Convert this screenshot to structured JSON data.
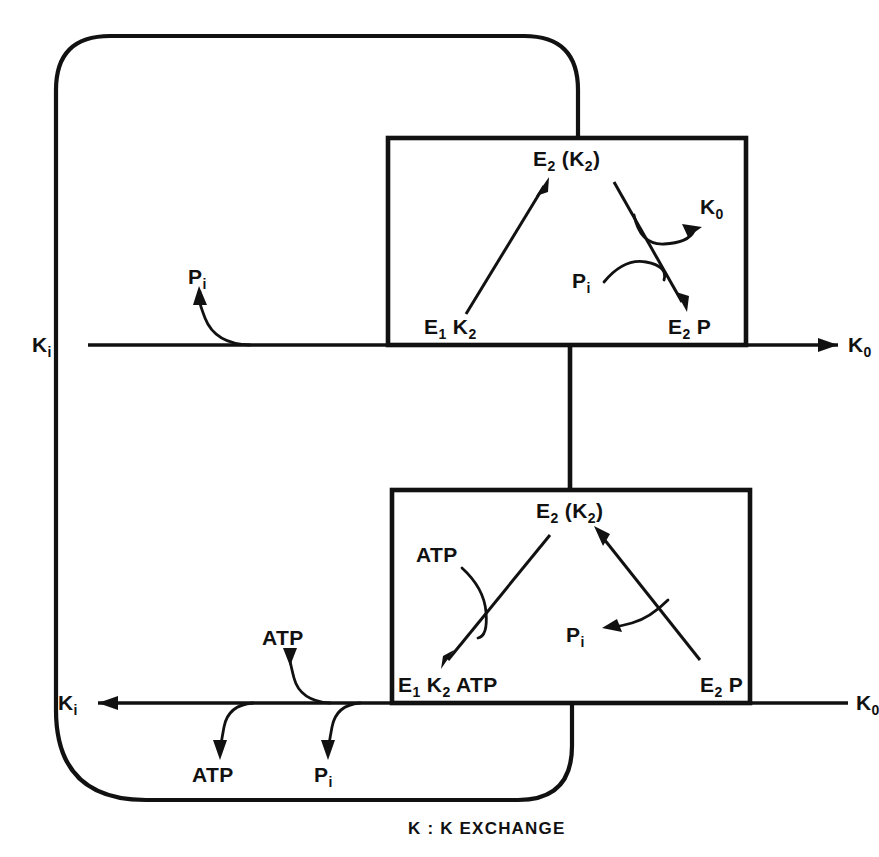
{
  "figure": {
    "caption": "K : K EXCHANGE",
    "ink_color": "#111111",
    "background_color": "#ffffff"
  },
  "upper_cycle": {
    "top_species": {
      "main": "E",
      "sub1": "2",
      "paren_open": " (K",
      "sub2": "2",
      "paren_close": ")"
    },
    "left_species": {
      "main": "E",
      "sub1": "1",
      "mid": " K",
      "sub2": "2"
    },
    "right_species": {
      "main": "E",
      "sub1": "2",
      "tail": " P"
    },
    "released_ligand": {
      "main": "K",
      "sub": "0"
    },
    "consumed_ligand": {
      "main": "P",
      "sub": "i"
    }
  },
  "lower_cycle": {
    "top_species": {
      "main": "E",
      "sub1": "2",
      "paren_open": " (K",
      "sub2": "2",
      "paren_close": ")"
    },
    "left_species": {
      "main": "E",
      "sub1": "1",
      "mid": " K",
      "sub2": "2",
      "tail": " ATP"
    },
    "right_species": {
      "main": "E",
      "sub1": "2",
      "tail": " P"
    },
    "consumed_ligand": "ATP",
    "released_ligand": {
      "main": "P",
      "sub": "i"
    }
  },
  "upper_rail": {
    "left_label": {
      "main": "K",
      "sub": "i"
    },
    "right_label": {
      "main": "K",
      "sub": "0"
    },
    "branch_label": {
      "main": "P",
      "sub": "i"
    },
    "direction": "left-to-right"
  },
  "lower_rail": {
    "left_label": {
      "main": "K",
      "sub": "i"
    },
    "right_label": {
      "main": "K",
      "sub": "0"
    },
    "branch_in_label": "ATP",
    "branch_out_atp_label": "ATP",
    "branch_out_pi_label": {
      "main": "P",
      "sub": "i"
    },
    "direction": "right-to-left"
  }
}
